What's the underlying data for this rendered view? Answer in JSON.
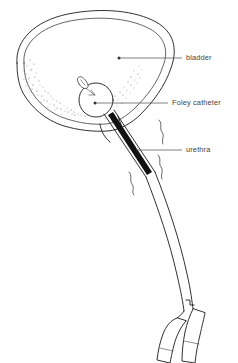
{
  "diagram": {
    "background_color": "#ffffff",
    "line_color": "#1a1a1a",
    "label_color": "#444444",
    "labels": [
      {
        "id": "bladder",
        "text": "bladder",
        "text_x": 186,
        "text_y": 58,
        "leader_x1": 119,
        "leader_y1": 58,
        "leader_x2": 182,
        "leader_y2": 58,
        "dot_x": 119,
        "dot_y": 58,
        "has_dot": true
      },
      {
        "id": "foley-catheter",
        "text": "Foley catheter",
        "text_x": 172,
        "text_y": 103,
        "leader_x1": 95,
        "leader_y1": 103,
        "leader_x2": 168,
        "leader_y2": 103,
        "dot_x": 95,
        "dot_y": 103,
        "has_dot": true
      },
      {
        "id": "urethra",
        "text": "urethra",
        "text_x": 186,
        "text_y": 150,
        "leader_x1": 136,
        "leader_y1": 150,
        "leader_x2": 182,
        "leader_y2": 150,
        "dot_x": 136,
        "dot_y": 150,
        "has_dot": false
      }
    ],
    "parts": {
      "bladder_wall_outer": "M 18,62 C 16,40 36,22 70,15 C 104,8 136,12 155,22 C 172,31 176,48 170,66 C 164,84 152,100 140,112 C 130,122 118,128 106,129 C 92,130 78,128 64,124 C 46,118 32,106 24,92 C 19,82 18,72 18,62 Z",
      "bladder_wall_inner": "M 25,62 C 23,43 41,28 71,22 C 102,16 131,19 148,28 C 163,36 167,50 162,65 C 157,81 146,95 135,106 C 126,115 115,121 105,122 C 92,123 80,121 67,117 C 51,112 38,101 31,88 C 26,79 25,70 25,62 Z",
      "balloon_cx": 96,
      "balloon_cy": 99,
      "balloon_r": 17,
      "tip_description": "catheter-tip-with-drainage-eye",
      "urethra_shaft_description": "dark-filled-tube-through-urethra",
      "drainage_tube_description": "curving-double-line-tube",
      "port_count": 2
    }
  }
}
